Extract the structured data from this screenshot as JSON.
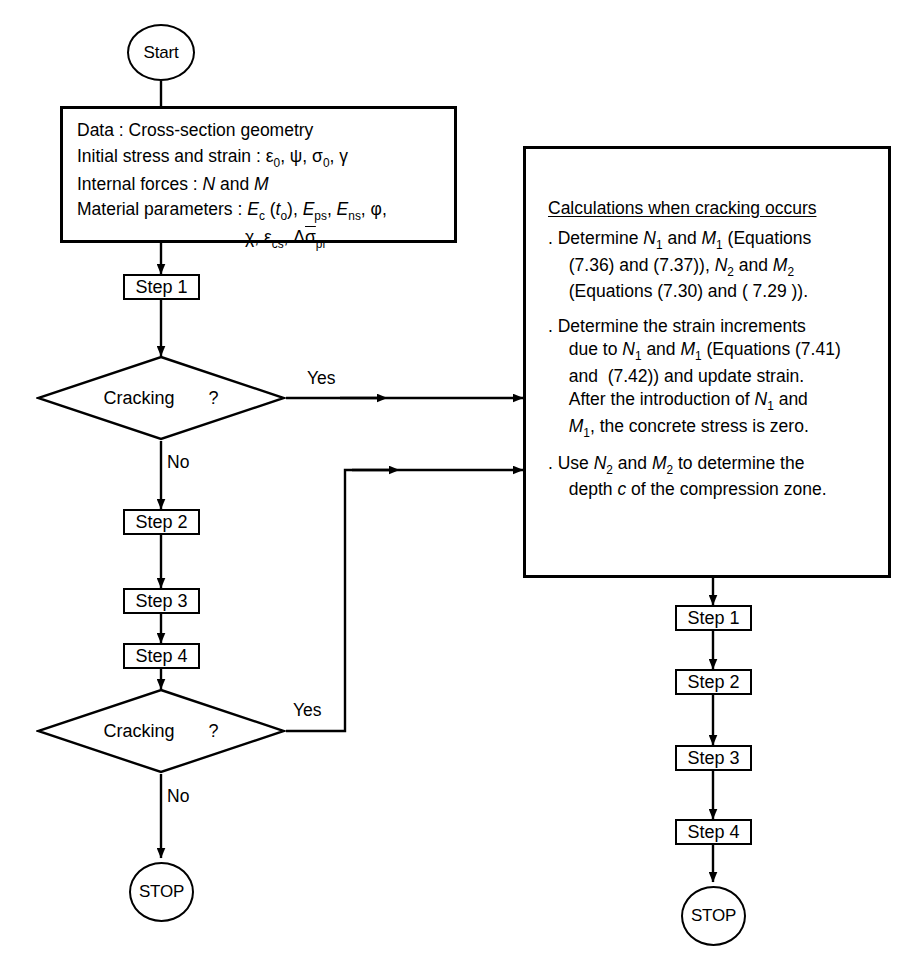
{
  "diagram": {
    "type": "flowchart",
    "line_color": "#000000",
    "background_color": "#ffffff"
  },
  "left_branch": {
    "start": {
      "label": "Start",
      "shape": "terminator"
    },
    "data_box": {
      "shape": "process-data",
      "lines": [
        "Data : Cross-section geometry",
        "Initial stress and strain : ε0, ψ, σ0, γ",
        "Internal forces : N and M",
        "Material parameters : Ec (to), Eps, Ens, φ,",
        "χ, εcs, Δσ̄pr"
      ],
      "line1_label": "Data :",
      "line1_value": "Cross-section geometry",
      "line2_label": "Initial stress and strain :",
      "line3_label": "Internal forces :",
      "line4_label": "Material parameters :"
    },
    "step1": {
      "label": "Step 1",
      "shape": "process"
    },
    "decision1": {
      "label": "Cracking",
      "question_mark": "?",
      "shape": "decision"
    },
    "decision1_yes": "Yes",
    "decision1_no": "No",
    "step2": {
      "label": "Step 2",
      "shape": "process"
    },
    "step3": {
      "label": "Step 3",
      "shape": "process"
    },
    "step4": {
      "label": "Step 4",
      "shape": "process"
    },
    "decision2": {
      "label": "Cracking",
      "question_mark": "?",
      "shape": "decision"
    },
    "decision2_yes": "Yes",
    "decision2_no": "No",
    "stop": {
      "label": "STOP",
      "shape": "terminator"
    }
  },
  "right_branch": {
    "calc_box": {
      "shape": "process-block",
      "title": "Calculations when cracking occurs",
      "items": [
        ". Determine N1 and M1 (Equations (7.36) and (7.37)), N2 and M2 (Equations (7.30) and ( 7.29 )).",
        ". Determine the strain increments due to N1 and M1 (Equations (7.41) and (7.42)) and update strain. After the introduction of N1 and M1, the concrete stress is zero.",
        ". Use N2 and M2 to determine the depth c of the compression zone."
      ]
    },
    "step1": {
      "label": "Step 1",
      "shape": "process"
    },
    "step2": {
      "label": "Step 2",
      "shape": "process"
    },
    "step3": {
      "label": "Step 3",
      "shape": "process"
    },
    "step4": {
      "label": "Step 4",
      "shape": "process"
    },
    "stop": {
      "label": "STOP",
      "shape": "terminator"
    }
  }
}
